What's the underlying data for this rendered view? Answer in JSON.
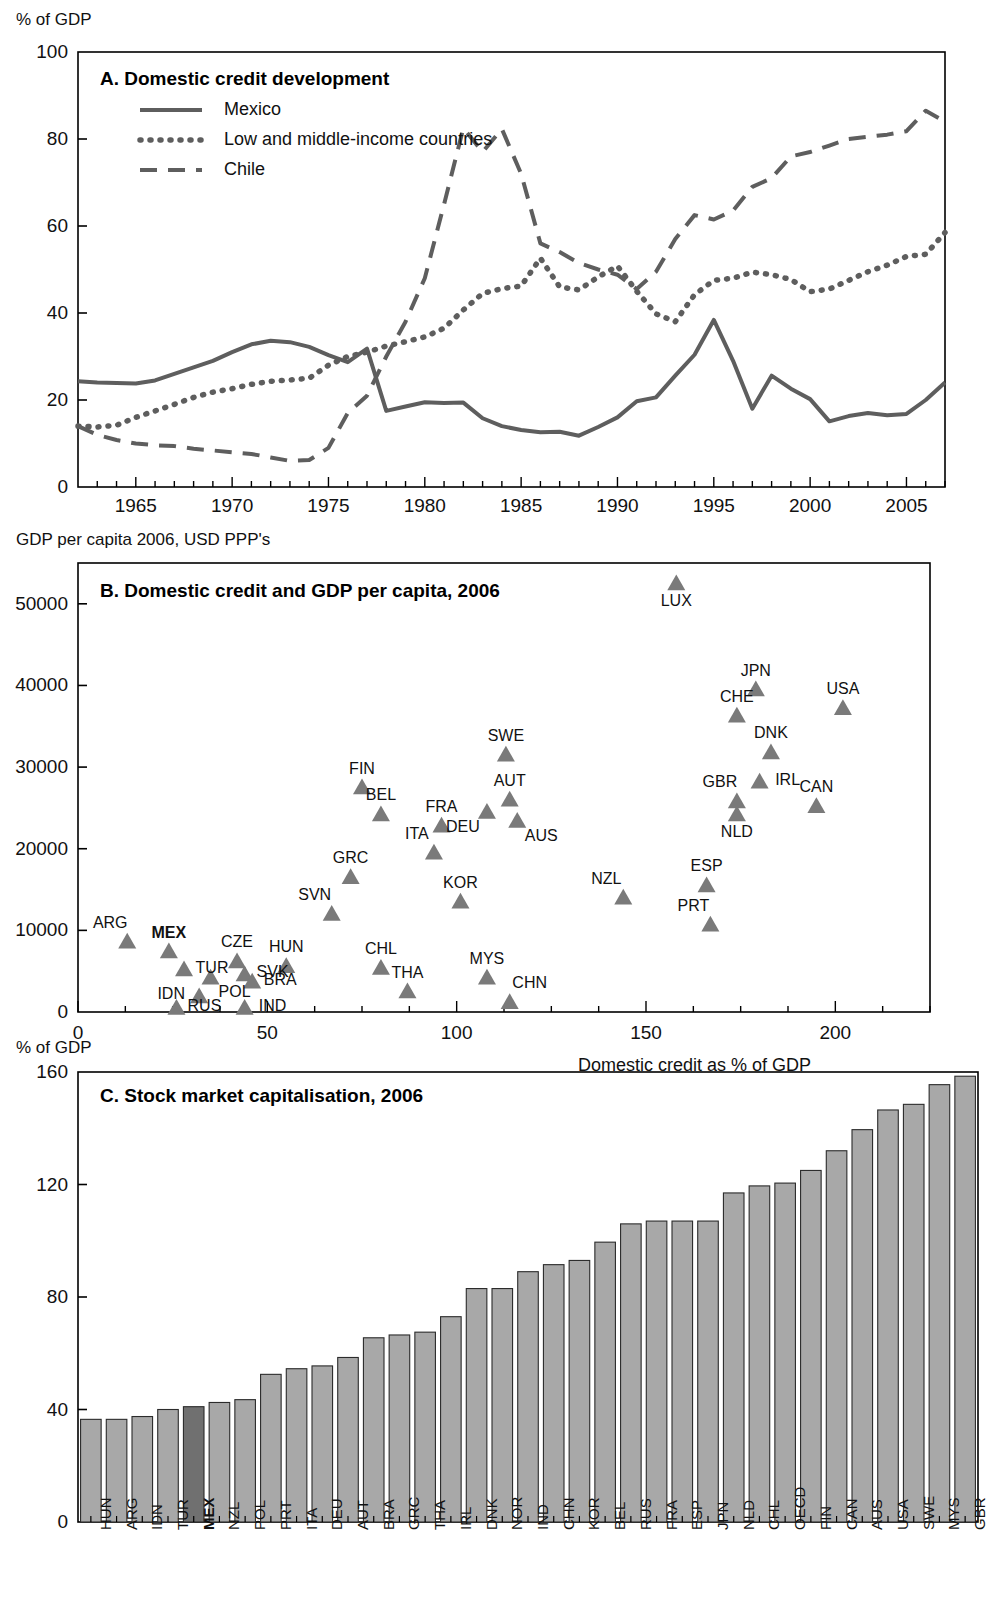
{
  "panels": {
    "a": {
      "title": "A. Domestic credit development",
      "ylabel": "% of GDP",
      "legend": [
        {
          "name": "Mexico",
          "style": "solid"
        },
        {
          "name": "Low and middle-income countries",
          "style": "dotted"
        },
        {
          "name": "Chile",
          "style": "dashed"
        }
      ]
    },
    "b": {
      "title": "B. Domestic credit and GDP per capita, 2006",
      "ylabel": "GDP per capita 2006, USD PPP's",
      "xlabel": "Domestic credit as % of GDP"
    },
    "c": {
      "title": "C. Stock market capitalisation, 2006",
      "ylabel": "% of GDP"
    }
  },
  "chart_data": [
    {
      "type": "line",
      "title": "A. Domestic credit development",
      "xlabel": "",
      "ylabel": "% of GDP",
      "xlim": [
        1962,
        2007
      ],
      "ylim": [
        0,
        100
      ],
      "yticks": [
        0,
        20,
        40,
        60,
        80,
        100
      ],
      "xticks": [
        1965,
        1970,
        1975,
        1980,
        1985,
        1990,
        1995,
        2000,
        2005
      ],
      "grid": false,
      "legend_position": "top-left",
      "x": [
        1962,
        1963,
        1964,
        1965,
        1966,
        1967,
        1968,
        1969,
        1970,
        1971,
        1972,
        1973,
        1974,
        1975,
        1976,
        1977,
        1978,
        1979,
        1980,
        1981,
        1982,
        1983,
        1984,
        1985,
        1986,
        1987,
        1988,
        1989,
        1990,
        1991,
        1992,
        1993,
        1994,
        1995,
        1996,
        1997,
        1998,
        1999,
        2000,
        2001,
        2002,
        2003,
        2004,
        2005,
        2006,
        2007
      ],
      "series": [
        {
          "name": "Mexico",
          "style": "solid",
          "values": [
            24.3,
            24.0,
            23.9,
            23.8,
            24.5,
            26.0,
            27.5,
            29.0,
            31.0,
            32.8,
            33.6,
            33.3,
            32.2,
            30.3,
            28.7,
            31.8,
            17.5,
            18.5,
            19.5,
            19.3,
            19.4,
            15.8,
            14.0,
            13.1,
            12.6,
            12.7,
            11.8,
            13.8,
            16.0,
            19.7,
            20.6,
            25.6,
            30.4,
            38.4,
            29.0,
            18.0,
            25.6,
            22.6,
            20.2,
            15.1,
            16.3,
            17.0,
            16.5,
            16.8,
            20.0,
            24.0
          ]
        },
        {
          "name": "Low and middle-income countries",
          "style": "dotted",
          "values": [
            14.0,
            13.8,
            14.2,
            16.0,
            17.5,
            19.0,
            20.6,
            21.8,
            22.6,
            23.6,
            24.3,
            24.6,
            25.0,
            28.0,
            30.0,
            31.0,
            32.4,
            33.4,
            34.5,
            36.5,
            40.7,
            44.5,
            45.6,
            46.2,
            52.6,
            46.0,
            45.3,
            48.3,
            50.8,
            45.0,
            39.8,
            38.0,
            44.2,
            47.5,
            48.0,
            49.4,
            48.8,
            47.7,
            44.9,
            45.5,
            47.5,
            49.5,
            51.0,
            53.0,
            53.5,
            58.5
          ]
        },
        {
          "name": "Chile",
          "style": "dashed",
          "values": [
            14.0,
            12.0,
            10.8,
            10.0,
            9.6,
            9.4,
            8.8,
            8.4,
            8.0,
            7.6,
            6.8,
            6.0,
            6.2,
            9.0,
            17.0,
            21.0,
            30.0,
            38.0,
            48.0,
            65.0,
            82.5,
            77.0,
            82.3,
            72.0,
            56.0,
            54.0,
            51.5,
            50.0,
            48.8,
            45.5,
            49.5,
            57.0,
            62.5,
            61.5,
            63.5,
            69.0,
            71.0,
            76.0,
            77.0,
            78.5,
            80.0,
            80.5,
            81.0,
            81.8,
            86.5,
            84.0
          ]
        }
      ]
    },
    {
      "type": "scatter",
      "title": "B. Domestic credit and GDP per capita, 2006",
      "xlabel": "Domestic credit as % of GDP",
      "ylabel": "GDP per capita 2006, USD PPP's",
      "xlim": [
        0,
        225
      ],
      "ylim": [
        0,
        55000
      ],
      "xticks": [
        0,
        50,
        100,
        150,
        200
      ],
      "yticks": [
        0,
        10000,
        20000,
        30000,
        40000,
        50000
      ],
      "grid": false,
      "marker": "triangle",
      "points": [
        {
          "code": "ARG",
          "x": 13,
          "y": 8600,
          "label_pos": "above-left",
          "bold": false
        },
        {
          "code": "MEX",
          "x": 24,
          "y": 7400,
          "label_pos": "above",
          "bold": true
        },
        {
          "code": "TUR",
          "x": 28,
          "y": 5200,
          "label_pos": "right",
          "bold": false
        },
        {
          "code": "IDN",
          "x": 32,
          "y": 1900,
          "label_pos": "left",
          "bold": false
        },
        {
          "code": "RUS",
          "x": 26,
          "y": 500,
          "label_pos": "right",
          "bold": false
        },
        {
          "code": "POL",
          "x": 35,
          "y": 4200,
          "label_pos": "below-right",
          "bold": false
        },
        {
          "code": "CZE",
          "x": 42,
          "y": 6200,
          "label_pos": "above",
          "bold": false
        },
        {
          "code": "SVK",
          "x": 44,
          "y": 4600,
          "label_pos": "right",
          "bold": false
        },
        {
          "code": "BRA",
          "x": 46,
          "y": 3700,
          "label_pos": "right",
          "bold": false
        },
        {
          "code": "IND",
          "x": 44,
          "y": 500,
          "label_pos": "right",
          "bold": false
        },
        {
          "code": "HUN",
          "x": 55,
          "y": 5600,
          "label_pos": "above",
          "bold": false
        },
        {
          "code": "SVN",
          "x": 67,
          "y": 12000,
          "label_pos": "above-left",
          "bold": false
        },
        {
          "code": "GRC",
          "x": 72,
          "y": 16500,
          "label_pos": "above",
          "bold": false
        },
        {
          "code": "FIN",
          "x": 75,
          "y": 27500,
          "label_pos": "above",
          "bold": false
        },
        {
          "code": "BEL",
          "x": 80,
          "y": 24200,
          "label_pos": "above",
          "bold": false
        },
        {
          "code": "CHL",
          "x": 80,
          "y": 5400,
          "label_pos": "above",
          "bold": false
        },
        {
          "code": "THA",
          "x": 87,
          "y": 2500,
          "label_pos": "above",
          "bold": false
        },
        {
          "code": "ITA",
          "x": 94,
          "y": 19500,
          "label_pos": "above-left",
          "bold": false
        },
        {
          "code": "FRA",
          "x": 96,
          "y": 22800,
          "label_pos": "above",
          "bold": false
        },
        {
          "code": "KOR",
          "x": 101,
          "y": 13500,
          "label_pos": "above",
          "bold": false
        },
        {
          "code": "DEU",
          "x": 108,
          "y": 24500,
          "label_pos": "below-left",
          "bold": false
        },
        {
          "code": "MYS",
          "x": 108,
          "y": 4200,
          "label_pos": "above",
          "bold": false
        },
        {
          "code": "SWE",
          "x": 113,
          "y": 31500,
          "label_pos": "above",
          "bold": false
        },
        {
          "code": "AUT",
          "x": 114,
          "y": 26000,
          "label_pos": "above",
          "bold": false
        },
        {
          "code": "AUS",
          "x": 116,
          "y": 23400,
          "label_pos": "below-right",
          "bold": false
        },
        {
          "code": "CHN",
          "x": 114,
          "y": 1200,
          "label_pos": "above-right",
          "bold": false
        },
        {
          "code": "NZL",
          "x": 144,
          "y": 14000,
          "label_pos": "above-left",
          "bold": false
        },
        {
          "code": "LUX",
          "x": 158,
          "y": 52500,
          "label_pos": "below",
          "bold": false
        },
        {
          "code": "PRT",
          "x": 167,
          "y": 10700,
          "label_pos": "above-left",
          "bold": false
        },
        {
          "code": "ESP",
          "x": 166,
          "y": 15500,
          "label_pos": "above",
          "bold": false
        },
        {
          "code": "NLD",
          "x": 174,
          "y": 24200,
          "label_pos": "below",
          "bold": false
        },
        {
          "code": "GBR",
          "x": 174,
          "y": 25800,
          "label_pos": "above-left",
          "bold": false
        },
        {
          "code": "CHE",
          "x": 174,
          "y": 36300,
          "label_pos": "above",
          "bold": false
        },
        {
          "code": "JPN",
          "x": 179,
          "y": 39500,
          "label_pos": "above",
          "bold": false
        },
        {
          "code": "IRL",
          "x": 180,
          "y": 28200,
          "label_pos": "right",
          "bold": false
        },
        {
          "code": "DNK",
          "x": 183,
          "y": 31800,
          "label_pos": "above",
          "bold": false
        },
        {
          "code": "CAN",
          "x": 195,
          "y": 25200,
          "label_pos": "above",
          "bold": false
        },
        {
          "code": "USA",
          "x": 202,
          "y": 37200,
          "label_pos": "above",
          "bold": false
        }
      ]
    },
    {
      "type": "bar",
      "title": "C. Stock market capitalisation, 2006",
      "xlabel": "",
      "ylabel": "% of GDP",
      "ylim": [
        0,
        160
      ],
      "yticks": [
        0,
        40,
        80,
        120,
        160
      ],
      "grid": false,
      "highlight": "MEX",
      "categories": [
        "HUN",
        "ARG",
        "IDN",
        "TUR",
        "MEX",
        "NZL",
        "POL",
        "PRT",
        "ITA",
        "DEU",
        "AUT",
        "BRA",
        "GRC",
        "THA",
        "IRL",
        "DNK",
        "NOR",
        "IND",
        "CHN",
        "KOR",
        "BEL",
        "RUS",
        "FRA",
        "ESP",
        "JPN",
        "NLD",
        "CHL",
        "OECD",
        "FIN",
        "CAN",
        "AUS",
        "USA",
        "SWE",
        "MYS",
        "GBR"
      ],
      "values": [
        36.5,
        36.5,
        37.5,
        40.0,
        41.0,
        42.5,
        43.5,
        52.5,
        54.5,
        55.5,
        58.5,
        65.5,
        66.5,
        67.5,
        73.0,
        83.0,
        83.0,
        89.0,
        91.5,
        93.0,
        99.5,
        106.0,
        107.0,
        107.0,
        107.0,
        117.0,
        119.5,
        120.5,
        125.0,
        132.0,
        139.5,
        146.5,
        148.5,
        155.5,
        158.5
      ]
    }
  ],
  "colors": {
    "line": "#5e5e5e",
    "marker": "#7a7a7a",
    "bar": "#a8a8a8",
    "bar_highlight": "#707070",
    "axis": "#000000",
    "text": "#111111"
  }
}
